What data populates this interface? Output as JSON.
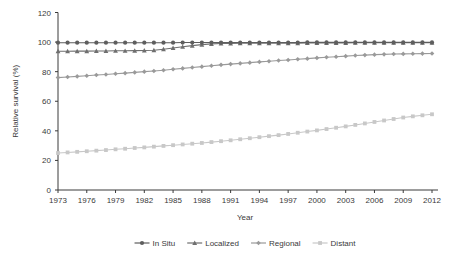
{
  "chart_data": {
    "type": "line",
    "title": "",
    "xlabel": "Year",
    "ylabel": "Relative survival (%)",
    "xlim": [
      1973,
      2012
    ],
    "ylim": [
      0,
      120
    ],
    "ytick_values": [
      0,
      20,
      40,
      60,
      80,
      100,
      120
    ],
    "ytick_labels": [
      "0",
      "20",
      "40",
      "60",
      "80",
      "100",
      "120"
    ],
    "xtick_values": [
      1973,
      1976,
      1979,
      1982,
      1985,
      1988,
      1991,
      1994,
      1997,
      2000,
      2003,
      2006,
      2009,
      2012
    ],
    "xtick_labels": [
      "1973",
      "1976",
      "1979",
      "1982",
      "1985",
      "1988",
      "1991",
      "1994",
      "1997",
      "2000",
      "2003",
      "2006",
      "2009",
      "2012"
    ],
    "grid": false,
    "legend_position": "bottom",
    "x": [
      1973,
      1974,
      1975,
      1976,
      1977,
      1978,
      1979,
      1980,
      1981,
      1982,
      1983,
      1984,
      1985,
      1986,
      1987,
      1988,
      1989,
      1990,
      1991,
      1992,
      1993,
      1994,
      1995,
      1996,
      1997,
      1998,
      1999,
      2000,
      2001,
      2002,
      2003,
      2004,
      2005,
      2006,
      2007,
      2008,
      2009,
      2010,
      2011,
      2012
    ],
    "series": [
      {
        "name": "In Situ",
        "color": "#5e5e5e",
        "marker": "circle",
        "values": [
          99.6,
          99.6,
          99.6,
          99.6,
          99.6,
          99.6,
          99.6,
          99.6,
          99.6,
          99.6,
          99.6,
          99.6,
          99.6,
          99.7,
          99.7,
          99.7,
          99.7,
          99.7,
          99.7,
          99.7,
          99.7,
          99.7,
          99.7,
          99.7,
          99.7,
          99.7,
          99.8,
          99.8,
          99.8,
          99.8,
          99.8,
          99.8,
          99.8,
          99.8,
          99.8,
          99.8,
          99.8,
          99.8,
          99.8,
          99.8
        ]
      },
      {
        "name": "Localized",
        "color": "#6f6f6f",
        "marker": "triangle",
        "values": [
          93.8,
          93.8,
          93.9,
          93.9,
          94.0,
          94.0,
          94.1,
          94.1,
          94.2,
          94.3,
          94.5,
          95.2,
          96.0,
          96.8,
          97.6,
          98.3,
          98.8,
          99.0,
          99.1,
          99.2,
          99.2,
          99.2,
          99.3,
          99.3,
          99.3,
          99.3,
          99.4,
          99.4,
          99.4,
          99.4,
          99.4,
          99.5,
          99.5,
          99.5,
          99.5,
          99.5,
          99.5,
          99.5,
          99.5,
          99.5
        ]
      },
      {
        "name": "Regional",
        "color": "#9a9a9a",
        "marker": "diamond",
        "values": [
          76.0,
          76.4,
          76.8,
          77.2,
          77.7,
          78.1,
          78.6,
          79.0,
          79.5,
          80.0,
          80.5,
          81.0,
          81.6,
          82.2,
          82.8,
          83.4,
          84.0,
          84.6,
          85.1,
          85.6,
          86.1,
          86.6,
          87.0,
          87.5,
          87.9,
          88.4,
          88.8,
          89.3,
          89.7,
          90.1,
          90.5,
          90.9,
          91.2,
          91.5,
          91.7,
          91.9,
          92.0,
          92.1,
          92.2,
          92.3
        ]
      },
      {
        "name": "Distant",
        "color": "#c8c8c8",
        "marker": "square",
        "values": [
          25.0,
          25.4,
          25.8,
          26.2,
          26.6,
          27.0,
          27.5,
          27.9,
          28.4,
          28.8,
          29.3,
          29.8,
          30.3,
          30.8,
          31.3,
          31.8,
          32.4,
          33.0,
          33.6,
          34.3,
          35.0,
          35.7,
          36.4,
          37.1,
          37.9,
          38.7,
          39.5,
          40.3,
          41.2,
          42.1,
          43.0,
          44.0,
          45.0,
          46.0,
          47.0,
          48.0,
          49.0,
          49.8,
          50.5,
          51.2
        ]
      }
    ]
  },
  "legend": {
    "items": [
      {
        "label": "In Situ"
      },
      {
        "label": "Localized"
      },
      {
        "label": "Regional"
      },
      {
        "label": "Distant"
      }
    ]
  }
}
